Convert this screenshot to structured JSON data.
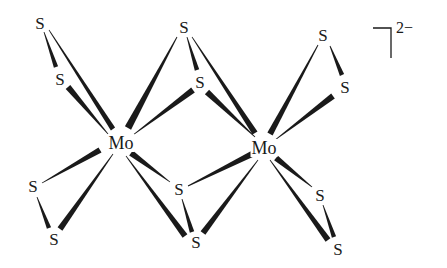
{
  "diagram": {
    "title": "",
    "type": "molecular-structure",
    "ink_color": "#1a1a1a",
    "background": "#ffffff",
    "charge": "2−",
    "atoms": [
      {
        "id": "mo1",
        "element": "Mo",
        "label": "Mo",
        "x": 121,
        "y": 143
      },
      {
        "id": "mo2",
        "element": "Mo",
        "label": "Mo",
        "x": 264,
        "y": 148
      },
      {
        "id": "s_a",
        "element": "S",
        "label": "S",
        "x": 40,
        "y": 23
      },
      {
        "id": "s_b",
        "element": "S",
        "label": "S",
        "x": 60,
        "y": 79
      },
      {
        "id": "s_c",
        "element": "S",
        "label": "S",
        "x": 184,
        "y": 27
      },
      {
        "id": "s_d",
        "element": "S",
        "label": "S",
        "x": 200,
        "y": 82
      },
      {
        "id": "s_e",
        "element": "S",
        "label": "S",
        "x": 323,
        "y": 35
      },
      {
        "id": "s_f",
        "element": "S",
        "label": "S",
        "x": 345,
        "y": 87
      },
      {
        "id": "s_g",
        "element": "S",
        "label": "S",
        "x": 33,
        "y": 186
      },
      {
        "id": "s_h",
        "element": "S",
        "label": "S",
        "x": 54,
        "y": 239
      },
      {
        "id": "s_i",
        "element": "S",
        "label": "S",
        "x": 179,
        "y": 189
      },
      {
        "id": "s_j",
        "element": "S",
        "label": "S",
        "x": 196,
        "y": 242
      },
      {
        "id": "s_k",
        "element": "S",
        "label": "S",
        "x": 320,
        "y": 195
      },
      {
        "id": "s_l",
        "element": "S",
        "label": "S",
        "x": 338,
        "y": 249
      }
    ],
    "bonds": [
      {
        "from": "s_a",
        "to": "s_b",
        "style": "wedge",
        "thin_end": "s_a",
        "x1": 44,
        "y1": 32,
        "x2": 56,
        "y2": 67,
        "w1": 0.8,
        "w2": 4.5
      },
      {
        "from": "s_a",
        "to": "mo1",
        "style": "wedge",
        "thin_end": "s_a",
        "x1": 49,
        "y1": 30,
        "x2": 113,
        "y2": 129,
        "w1": 0.8,
        "w2": 5
      },
      {
        "from": "s_b",
        "to": "mo1",
        "style": "wedge",
        "thin_end": "mo1",
        "x1": 68,
        "y1": 87,
        "x2": 108,
        "y2": 134,
        "w1": 6,
        "w2": 0.8
      },
      {
        "from": "s_c",
        "to": "mo1",
        "style": "wedge",
        "thin_end": "s_c",
        "x1": 177,
        "y1": 37,
        "x2": 128,
        "y2": 128,
        "w1": 0.8,
        "w2": 7
      },
      {
        "from": "s_d",
        "to": "mo1",
        "style": "wedge",
        "thin_end": "mo1",
        "x1": 193,
        "y1": 90,
        "x2": 133,
        "y2": 135,
        "w1": 6,
        "w2": 0.8
      },
      {
        "from": "s_c",
        "to": "s_d",
        "style": "wedge",
        "thin_end": "s_c",
        "x1": 187,
        "y1": 37,
        "x2": 197,
        "y2": 70,
        "w1": 0.8,
        "w2": 4.5
      },
      {
        "from": "s_c",
        "to": "mo2",
        "style": "wedge",
        "thin_end": "s_c",
        "x1": 192,
        "y1": 37,
        "x2": 255,
        "y2": 133,
        "w1": 0.8,
        "w2": 6
      },
      {
        "from": "s_d",
        "to": "mo2",
        "style": "wedge",
        "thin_end": "mo2",
        "x1": 207,
        "y1": 92,
        "x2": 255,
        "y2": 137,
        "w1": 6,
        "w2": 0.8
      },
      {
        "from": "s_e",
        "to": "mo2",
        "style": "wedge",
        "thin_end": "s_e",
        "x1": 318,
        "y1": 45,
        "x2": 270,
        "y2": 134,
        "w1": 0.8,
        "w2": 6
      },
      {
        "from": "s_e",
        "to": "s_f",
        "style": "wedge",
        "thin_end": "s_e",
        "x1": 330,
        "y1": 46,
        "x2": 342,
        "y2": 75,
        "w1": 0.8,
        "w2": 4.5
      },
      {
        "from": "s_f",
        "to": "mo2",
        "style": "wedge",
        "thin_end": "mo2",
        "x1": 333,
        "y1": 96,
        "x2": 275,
        "y2": 140,
        "w1": 6,
        "w2": 0.8
      },
      {
        "from": "s_g",
        "to": "mo1",
        "style": "wedge",
        "thin_end": "s_g",
        "x1": 42,
        "y1": 183,
        "x2": 100,
        "y2": 150,
        "w1": 0.8,
        "w2": 6
      },
      {
        "from": "s_g",
        "to": "s_h",
        "style": "wedge",
        "thin_end": "s_g",
        "x1": 37,
        "y1": 197,
        "x2": 49,
        "y2": 228,
        "w1": 0.8,
        "w2": 4.5
      },
      {
        "from": "s_h",
        "to": "mo1",
        "style": "wedge",
        "thin_end": "mo1",
        "x1": 60,
        "y1": 229,
        "x2": 113,
        "y2": 154,
        "w1": 6,
        "w2": 0.8
      },
      {
        "from": "mo1",
        "to": "s_i",
        "style": "wedge",
        "thin_end": "s_i",
        "x1": 131,
        "y1": 153,
        "x2": 170,
        "y2": 182,
        "w1": 6,
        "w2": 0.8
      },
      {
        "from": "mo1",
        "to": "s_j",
        "style": "wedge",
        "thin_end": "mo1",
        "x1": 126,
        "y1": 156,
        "x2": 185,
        "y2": 236,
        "w1": 0.8,
        "w2": 6
      },
      {
        "from": "s_i",
        "to": "s_j",
        "style": "wedge",
        "thin_end": "s_i",
        "x1": 182,
        "y1": 199,
        "x2": 192,
        "y2": 232,
        "w1": 0.8,
        "w2": 4.5
      },
      {
        "from": "s_i",
        "to": "mo2",
        "style": "wedge",
        "thin_end": "s_i",
        "x1": 188,
        "y1": 186,
        "x2": 252,
        "y2": 154,
        "w1": 0.8,
        "w2": 6
      },
      {
        "from": "s_j",
        "to": "mo2",
        "style": "wedge",
        "thin_end": "mo2",
        "x1": 203,
        "y1": 233,
        "x2": 258,
        "y2": 160,
        "w1": 6,
        "w2": 0.8
      },
      {
        "from": "mo2",
        "to": "s_k",
        "style": "wedge",
        "thin_end": "s_k",
        "x1": 276,
        "y1": 158,
        "x2": 312,
        "y2": 187,
        "w1": 6,
        "w2": 0.8
      },
      {
        "from": "mo2",
        "to": "s_l",
        "style": "wedge",
        "thin_end": "mo2",
        "x1": 270,
        "y1": 160,
        "x2": 328,
        "y2": 240,
        "w1": 0.8,
        "w2": 6
      },
      {
        "from": "s_k",
        "to": "s_l",
        "style": "wedge",
        "thin_end": "s_k",
        "x1": 323,
        "y1": 205,
        "x2": 334,
        "y2": 237,
        "w1": 0.8,
        "w2": 4.5
      }
    ],
    "bracket": {
      "x_left": 373,
      "x_corner": 391,
      "y_top": 28,
      "y_bottom": 58
    }
  }
}
